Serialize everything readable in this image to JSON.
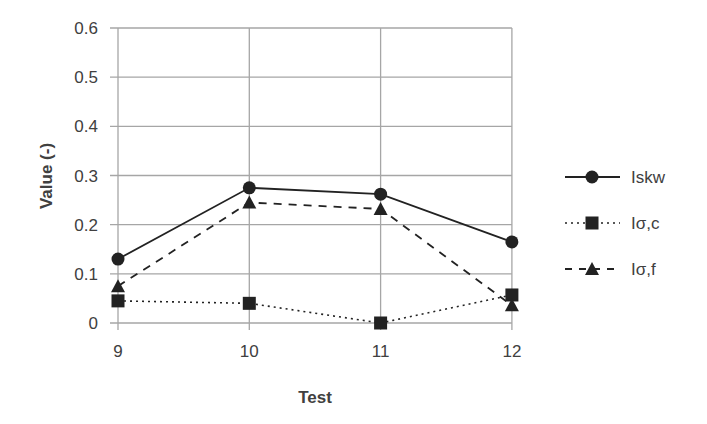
{
  "chart_data": {
    "type": "line",
    "title": "",
    "xlabel": "Test",
    "ylabel": "Value (-)",
    "categories": [
      "9",
      "10",
      "11",
      "12"
    ],
    "x": [
      9,
      10,
      11,
      12
    ],
    "ylim": [
      0,
      0.6
    ],
    "yticks": [
      "0",
      "0.1",
      "0.2",
      "0.3",
      "0.4",
      "0.5",
      "0.6"
    ],
    "grid": true,
    "legend_position": "right",
    "series": [
      {
        "name": "Iskw",
        "values": [
          0.13,
          0.275,
          0.262,
          0.165
        ],
        "line": "solid",
        "marker": "circle",
        "color": "#222222"
      },
      {
        "name": "Iσ,c",
        "values": [
          0.045,
          0.04,
          0.0,
          0.057
        ],
        "line": "dotted",
        "marker": "square",
        "color": "#222222"
      },
      {
        "name": "Iσ,f",
        "values": [
          0.075,
          0.245,
          0.232,
          0.036
        ],
        "line": "dashed",
        "marker": "triangle",
        "color": "#222222"
      }
    ]
  },
  "colors": {
    "grid": "#a6a6a6",
    "series": "#222222",
    "text": "#404040"
  }
}
